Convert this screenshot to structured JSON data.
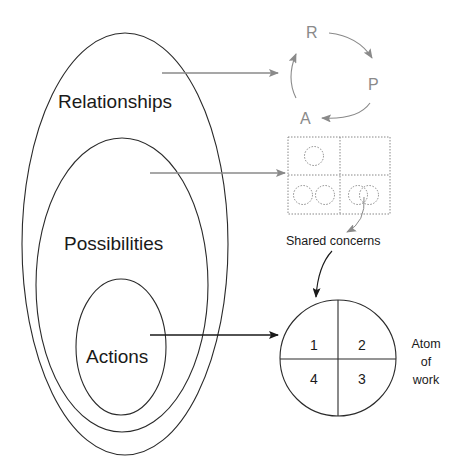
{
  "diagram": {
    "nested_sets": [
      {
        "label": "Relationships"
      },
      {
        "label": "Possibilities"
      },
      {
        "label": "Actions"
      }
    ],
    "cycle": {
      "nodes": [
        "R",
        "P",
        "A"
      ]
    },
    "grid": {
      "annotation": "Shared concerns"
    },
    "atom": {
      "quadrants": [
        "1",
        "2",
        "4",
        "3"
      ],
      "label_lines": [
        "Atom",
        "of",
        "work"
      ]
    },
    "colors": {
      "line": "#2a2a2a",
      "grey": "#8a8a8a",
      "dotted": "#888888"
    }
  }
}
